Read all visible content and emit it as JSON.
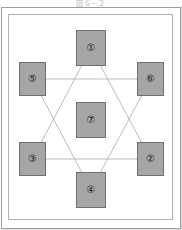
{
  "figure": {
    "caption": "図６－２",
    "frame": {
      "outer_border_color": "#9d9d9d",
      "inner_border_color": "#b0b0b0",
      "background_color": "#ffffff"
    },
    "style": {
      "card_fill": "#a6a6a6",
      "card_border": "#6f6f6f",
      "link_color": "#b3b3b3",
      "label_color": "#1c1c1c"
    },
    "nodes": [
      {
        "id": "node-1",
        "label": "①",
        "number": "1",
        "position": "top-center",
        "x": 76,
        "y": 30,
        "w": 30,
        "h": 36
      },
      {
        "id": "node-2",
        "label": "②",
        "number": "2",
        "position": "bottom-right",
        "x": 137,
        "y": 142,
        "w": 27,
        "h": 34
      },
      {
        "id": "node-3",
        "label": "③",
        "number": "3",
        "position": "bottom-left",
        "x": 19,
        "y": 142,
        "w": 27,
        "h": 34
      },
      {
        "id": "node-4",
        "label": "④",
        "number": "4",
        "position": "bottom-center",
        "x": 76,
        "y": 172,
        "w": 30,
        "h": 36
      },
      {
        "id": "node-5",
        "label": "⑤",
        "number": "5",
        "position": "top-left",
        "x": 19,
        "y": 62,
        "w": 27,
        "h": 34
      },
      {
        "id": "node-6",
        "label": "⑥",
        "number": "6",
        "position": "top-right",
        "x": 137,
        "y": 62,
        "w": 27,
        "h": 34
      },
      {
        "id": "node-7",
        "label": "⑦",
        "number": "7",
        "position": "center",
        "x": 76,
        "y": 102,
        "w": 30,
        "h": 36
      }
    ],
    "links": [
      {
        "id": "link-1-3",
        "from": "node-1",
        "to": "node-3"
      },
      {
        "id": "link-1-2",
        "from": "node-1",
        "to": "node-2"
      },
      {
        "id": "link-3-2",
        "from": "node-3",
        "to": "node-2"
      },
      {
        "id": "link-4-5",
        "from": "node-4",
        "to": "node-5"
      },
      {
        "id": "link-4-6",
        "from": "node-4",
        "to": "node-6"
      },
      {
        "id": "link-5-6",
        "from": "node-5",
        "to": "node-6"
      }
    ]
  }
}
